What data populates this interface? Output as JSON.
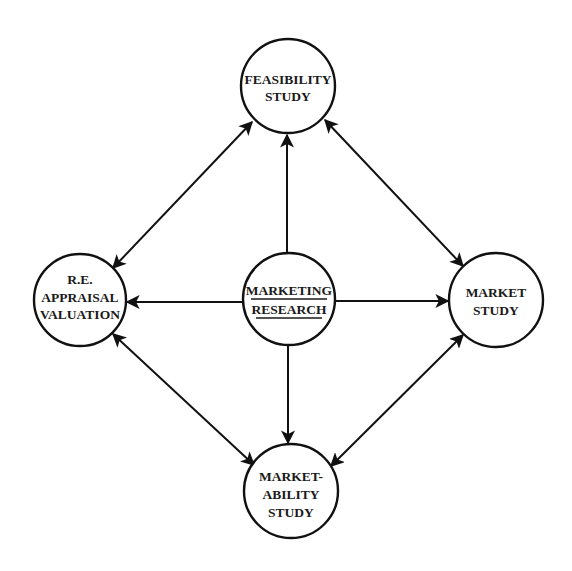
{
  "diagram": {
    "type": "concept-relationship diagram",
    "colors": {
      "line": "#111111",
      "text": "#1a1a1a",
      "background": "#ffffff"
    },
    "nodes": {
      "feasibility": {
        "lines": [
          "FEASIBILITY",
          "STUDY"
        ]
      },
      "appraisal": {
        "lines": [
          "R.E.",
          "APPRAISAL",
          "VALUATION"
        ]
      },
      "marketing_research": {
        "lines": [
          "MARKETING",
          "RESEARCH"
        ],
        "underlined": true
      },
      "market_study": {
        "lines": [
          "MARKET",
          "STUDY"
        ]
      },
      "marketability": {
        "lines": [
          "MARKET-",
          "ABILITY",
          "STUDY"
        ]
      }
    },
    "edges": [
      {
        "from": "marketing_research",
        "to": "feasibility",
        "direction": "one-way"
      },
      {
        "from": "marketing_research",
        "to": "appraisal",
        "direction": "one-way"
      },
      {
        "from": "marketing_research",
        "to": "market_study",
        "direction": "one-way"
      },
      {
        "from": "marketing_research",
        "to": "marketability",
        "direction": "one-way"
      },
      {
        "from": "feasibility",
        "to": "appraisal",
        "direction": "two-way"
      },
      {
        "from": "feasibility",
        "to": "market_study",
        "direction": "two-way"
      },
      {
        "from": "appraisal",
        "to": "marketability",
        "direction": "two-way"
      },
      {
        "from": "market_study",
        "to": "marketability",
        "direction": "two-way"
      }
    ]
  }
}
